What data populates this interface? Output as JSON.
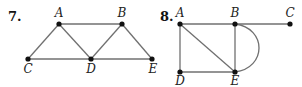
{
  "figures": [
    {
      "number": "7.",
      "number_pos": [
        8,
        21
      ],
      "nodes": [
        {
          "id": "A",
          "label": "A",
          "x": 59,
          "y": 24,
          "lx": 59,
          "ly": 17
        },
        {
          "id": "B",
          "label": "B",
          "x": 122,
          "y": 24,
          "lx": 122,
          "ly": 17
        },
        {
          "id": "C",
          "label": "C",
          "x": 28,
          "y": 59,
          "lx": 28,
          "ly": 73
        },
        {
          "id": "D",
          "label": "D",
          "x": 91,
          "y": 59,
          "lx": 91,
          "ly": 73
        },
        {
          "id": "E",
          "label": "E",
          "x": 152,
          "y": 59,
          "lx": 153,
          "ly": 73
        }
      ],
      "edges": [
        [
          "A",
          "B"
        ],
        [
          "A",
          "C"
        ],
        [
          "A",
          "D"
        ],
        [
          "B",
          "D"
        ],
        [
          "B",
          "E"
        ],
        [
          "C",
          "D"
        ],
        [
          "D",
          "E"
        ]
      ]
    },
    {
      "number": "8.",
      "number_pos": [
        160,
        21
      ],
      "nodes": [
        {
          "id": "A",
          "label": "A",
          "x": 180,
          "y": 24,
          "lx": 180,
          "ly": 17
        },
        {
          "id": "B",
          "label": "B",
          "x": 235,
          "y": 24,
          "lx": 235,
          "ly": 17
        },
        {
          "id": "C",
          "label": "C",
          "x": 290,
          "y": 24,
          "lx": 290,
          "ly": 17
        },
        {
          "id": "D",
          "label": "D",
          "x": 180,
          "y": 72,
          "lx": 180,
          "ly": 85
        },
        {
          "id": "E",
          "label": "E",
          "x": 235,
          "y": 72,
          "lx": 235,
          "ly": 85
        }
      ],
      "edges": [
        [
          "A",
          "B"
        ],
        [
          "B",
          "C"
        ],
        [
          "A",
          "D"
        ],
        [
          "A",
          "E"
        ],
        [
          "B",
          "E"
        ],
        [
          "D",
          "E"
        ]
      ],
      "curved_edges": [
        {
          "from": "B",
          "to": "E",
          "bulge": 32
        }
      ]
    }
  ]
}
